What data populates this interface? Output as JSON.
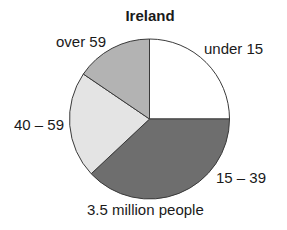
{
  "chart_data": {
    "type": "pie",
    "title": "Ireland",
    "subtitle": "3.5 million people",
    "categories": [
      "under 15",
      "15 – 39",
      "40 – 59",
      "over 59"
    ],
    "values": [
      25,
      38,
      21.5,
      15.5
    ],
    "unit": "percent (estimated from slice angles)",
    "colors": [
      "#ffffff",
      "#6e6e6e",
      "#e4e4e4",
      "#b3b3b3"
    ],
    "start_angle": "12 o'clock, clockwise",
    "legend": "none (direct labels)"
  },
  "labels": {
    "title": "Ireland",
    "footer": "3.5 million people",
    "under15": "under 15",
    "a15_39": "15 – 39",
    "a40_59": "40 – 59",
    "over59": "over 59"
  }
}
